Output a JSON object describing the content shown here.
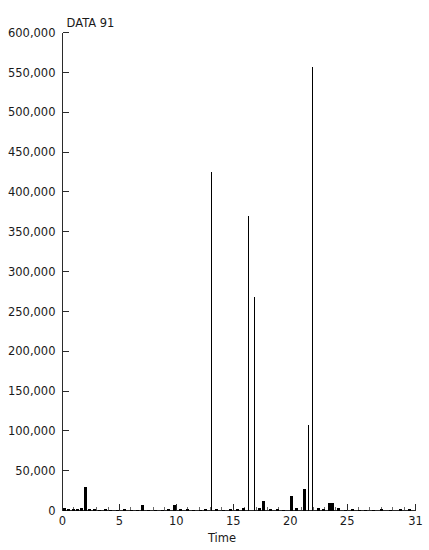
{
  "chart_data": {
    "type": "bar",
    "title": "DATA 91",
    "xlabel": "Time",
    "ylabel": "",
    "xlim": [
      0,
      31
    ],
    "ylim": [
      0,
      600000
    ],
    "grid": false,
    "legend": null,
    "ytick_labels": [
      "0",
      "50,000",
      "100,000",
      "150,000",
      "200,000",
      "250,000",
      "300,000",
      "350,000",
      "400,000",
      "450,000",
      "500,000",
      "550,000",
      "600,000"
    ],
    "ytick_values": [
      0,
      50000,
      100000,
      150000,
      200000,
      250000,
      300000,
      350000,
      400000,
      450000,
      500000,
      550000,
      600000
    ],
    "xtick_labels": [
      "0",
      "5",
      "10",
      "15",
      "20",
      "25",
      "31"
    ],
    "xtick_values": [
      0,
      5,
      10,
      15,
      20,
      25,
      31
    ],
    "xtick_minor_step": 1,
    "bar_color": "#000000",
    "x": [
      0.15,
      0.45,
      0.9,
      1.3,
      1.65,
      2.0,
      2.35,
      2.75,
      3.2,
      3.7,
      4.2,
      4.8,
      5.4,
      6.0,
      6.5,
      7.0,
      7.5,
      8.1,
      8.7,
      9.3,
      9.8,
      10.3,
      10.9,
      11.5,
      12.1,
      12.55,
      13.0,
      13.5,
      14.1,
      14.7,
      15.3,
      15.85,
      16.3,
      16.8,
      17.25,
      17.65,
      18.2,
      18.8,
      19.4,
      20.05,
      20.5,
      21.2,
      21.55,
      21.9,
      22.4,
      22.9,
      23.4,
      23.7,
      24.2,
      24.8,
      25.4,
      26.0,
      26.6,
      27.3,
      28.0,
      28.8,
      29.6,
      30.4
    ],
    "values": [
      3000,
      1500,
      2000,
      2500,
      3000,
      30000,
      2000,
      1500,
      1200,
      1500,
      1000,
      1200,
      1500,
      1200,
      1000,
      7500,
      1200,
      1000,
      1200,
      1500,
      7000,
      2500,
      1500,
      1200,
      1000,
      1500,
      425000,
      2500,
      1200,
      1500,
      2000,
      3000,
      370000,
      268000,
      3000,
      12000,
      2500,
      1500,
      1200,
      18000,
      3500,
      27000,
      107000,
      557000,
      3000,
      1500,
      9000,
      10000,
      3000,
      1200,
      1500,
      1000,
      1200,
      1000,
      1500,
      1200,
      2000,
      1500
    ],
    "notable_peaks": [
      {
        "x": 2.0,
        "value": 30000
      },
      {
        "x": 13.0,
        "value": 425000
      },
      {
        "x": 16.3,
        "value": 370000
      },
      {
        "x": 16.8,
        "value": 268000
      },
      {
        "x": 21.2,
        "value": 107000
      },
      {
        "x": 21.9,
        "value": 557000
      }
    ]
  }
}
